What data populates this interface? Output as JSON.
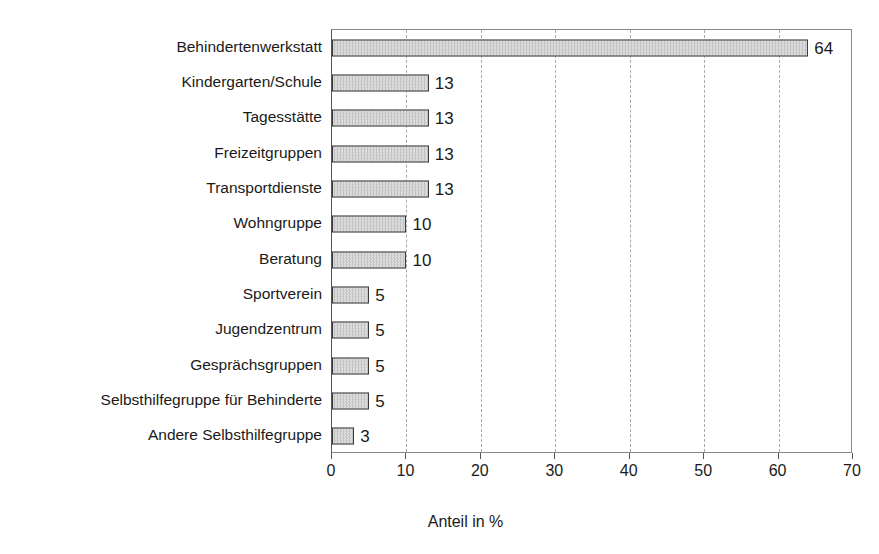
{
  "chart_data": {
    "type": "bar",
    "orientation": "horizontal",
    "title": "",
    "subtitle": "",
    "xlabel": "Anteil in %",
    "ylabel": "",
    "xlim": [
      0,
      70
    ],
    "xticks": [
      0,
      10,
      20,
      30,
      40,
      50,
      60,
      70
    ],
    "xtick_labels": [
      "0",
      "10",
      "20",
      "30",
      "40",
      "50",
      "60",
      "70"
    ],
    "grid": "vertical-dashed",
    "legend": "none",
    "categories": [
      "Behindertenwerkstatt",
      "Kindergarten/Schule",
      "Tagesstätte",
      "Freizeitgruppen",
      "Transportdienste",
      "Wohngruppe",
      "Beratung",
      "Sportverein",
      "Jugendzentrum",
      "Gesprächsgruppen",
      "Selbsthilfegruppe für  Behinderte",
      "Andere Selbsthilfegruppe"
    ],
    "values": [
      64,
      13,
      13,
      13,
      13,
      10,
      10,
      5,
      5,
      5,
      5,
      3
    ],
    "value_labels": [
      "64",
      "13",
      "13",
      "13",
      "13",
      "10",
      "10",
      "5",
      "5",
      "5",
      "5",
      "3"
    ],
    "bar_fill_color": "#d2d2d2",
    "bar_edge_color": "#3a3a3a",
    "gridline_color": "#aaaaaa",
    "axis_color": "#555555",
    "background_color": "#ffffff",
    "text_color": "#1a1a1a"
  }
}
